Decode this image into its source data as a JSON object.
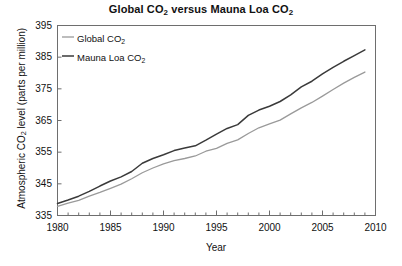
{
  "chart_data": {
    "type": "line",
    "title": "Global CO2 versus Mauna Loa CO2",
    "title_parts": [
      "Global CO",
      "2",
      " versus Mauna Loa CO",
      "2"
    ],
    "xlabel": "Year",
    "ylabel": "Atmospheric CO2 level (parts per million)",
    "ylabel_parts": [
      "Atmospheric CO",
      "2",
      " level (parts per million)"
    ],
    "xlim": [
      1980,
      2010
    ],
    "ylim": [
      335,
      395
    ],
    "xticks": [
      1980,
      1985,
      1990,
      1995,
      2000,
      2005,
      2010
    ],
    "xtick_labels": [
      "1980",
      "1985",
      "1990",
      "1995",
      "2000",
      "2005",
      "2010"
    ],
    "xminor_tick_step": 1,
    "yticks": [
      335,
      345,
      355,
      365,
      375,
      385,
      395
    ],
    "ytick_labels": [
      "335",
      "345",
      "355",
      "365",
      "375",
      "385",
      "395"
    ],
    "grid": false,
    "legend_position": "upper left",
    "x": [
      1980,
      1981,
      1982,
      1983,
      1984,
      1985,
      1986,
      1987,
      1988,
      1989,
      1990,
      1991,
      1992,
      1993,
      1994,
      1995,
      1996,
      1997,
      1998,
      1999,
      2000,
      2001,
      2002,
      2003,
      2004,
      2005,
      2006,
      2007,
      2008,
      2009
    ],
    "series": [
      {
        "name": "Global CO2",
        "name_parts": [
          "Global CO",
          "2"
        ],
        "color": "#9a9a9a",
        "width": 1.3,
        "values": [
          337.9,
          338.9,
          339.8,
          341.1,
          342.3,
          343.6,
          344.9,
          346.6,
          348.5,
          350.0,
          351.3,
          352.3,
          353.0,
          353.8,
          355.3,
          356.2,
          357.8,
          358.9,
          360.9,
          362.7,
          363.9,
          365.1,
          367.1,
          369.0,
          370.7,
          372.7,
          374.8,
          376.8,
          378.6,
          380.3
        ]
      },
      {
        "name": "Mauna Loa CO2",
        "name_parts": [
          "Mauna Loa CO",
          "2"
        ],
        "color": "#3a3a3a",
        "width": 1.5,
        "values": [
          338.8,
          339.9,
          341.1,
          342.6,
          344.3,
          345.9,
          347.2,
          348.9,
          351.5,
          353.0,
          354.2,
          355.5,
          356.3,
          357.0,
          358.8,
          360.7,
          362.5,
          363.7,
          366.6,
          368.3,
          369.5,
          371.0,
          373.1,
          375.6,
          377.4,
          379.7,
          381.8,
          383.7,
          385.5,
          387.3
        ]
      }
    ]
  },
  "legend": {
    "entries": [
      {
        "label": "Global CO2",
        "label_parts": [
          "Global CO",
          "2"
        ],
        "color": "#9a9a9a"
      },
      {
        "label": "Mauna Loa CO2",
        "label_parts": [
          "Mauna Loa CO",
          "2"
        ],
        "color": "#3a3a3a"
      }
    ]
  },
  "axes": {
    "frame_color": "#6e6e6e",
    "tick_color": "#6e6e6e"
  }
}
